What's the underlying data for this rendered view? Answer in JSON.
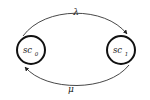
{
  "diagram": {
    "type": "state-transition",
    "states": [
      {
        "id": "sc0",
        "label": "sc",
        "subscript": "0"
      },
      {
        "id": "sc1",
        "label": "sc",
        "subscript": "1"
      }
    ],
    "transitions": [
      {
        "from": "sc0",
        "to": "sc1",
        "label": "λ"
      },
      {
        "from": "sc1",
        "to": "sc0",
        "label": "μ"
      }
    ]
  }
}
